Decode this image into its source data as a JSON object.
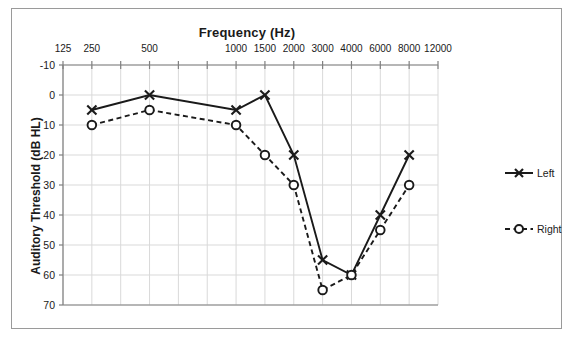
{
  "chart_data": {
    "type": "line",
    "title": "Frequency (Hz)",
    "xlabel": "Frequency (Hz)",
    "ylabel": "Auditory Threshold (dB HL)",
    "categories": [
      "125",
      "250",
      "",
      "500",
      "",
      "",
      "1000",
      "1500",
      "2000",
      "3000",
      "4000",
      "6000",
      "8000",
      "12000"
    ],
    "xtick_labels": [
      "125",
      "250",
      "500",
      "1000",
      "1500",
      "2000",
      "3000",
      "4000",
      "6000",
      "8000",
      "12000"
    ],
    "ytick_labels": [
      "-10",
      "0",
      "10",
      "20",
      "30",
      "40",
      "50",
      "60",
      "70"
    ],
    "ylim": [
      -10,
      70
    ],
    "y_inverted": true,
    "grid": true,
    "legend_position": "right",
    "series": [
      {
        "name": "Left",
        "marker": "x",
        "line_style": "solid",
        "color": "#1a1a1a",
        "x": [
          "250",
          "500",
          "1000",
          "1500",
          "2000",
          "3000",
          "4000",
          "6000",
          "8000"
        ],
        "values": [
          5,
          0,
          5,
          0,
          20,
          55,
          60,
          40,
          20
        ]
      },
      {
        "name": "Right",
        "marker": "circle",
        "line_style": "dashed",
        "color": "#1a1a1a",
        "x": [
          "250",
          "500",
          "1000",
          "1500",
          "2000",
          "3000",
          "4000",
          "6000",
          "8000"
        ],
        "values": [
          10,
          5,
          10,
          20,
          30,
          65,
          60,
          45,
          30
        ]
      }
    ]
  },
  "legend": {
    "items": [
      {
        "label": "Left"
      },
      {
        "label": "Right"
      }
    ]
  },
  "colors": {
    "line": "#1a1a1a",
    "grid": "#d9d9d9",
    "axis": "#808080",
    "frame": "#9a9a9a",
    "text": "#1a1a1a"
  }
}
